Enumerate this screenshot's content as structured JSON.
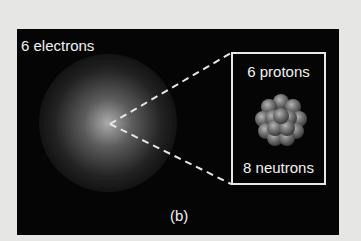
{
  "figure": {
    "label": "(b)",
    "electron_cloud": {
      "label": "6 electrons"
    },
    "nucleus_inset": {
      "protons_label": "6 protons",
      "neutrons_label": "8 neutrons"
    },
    "colors": {
      "page_background": "#e6e6e4",
      "panel_background": "#050505",
      "text": "#f2f2f2",
      "nucleus_particle": "#7a7a7a"
    }
  }
}
